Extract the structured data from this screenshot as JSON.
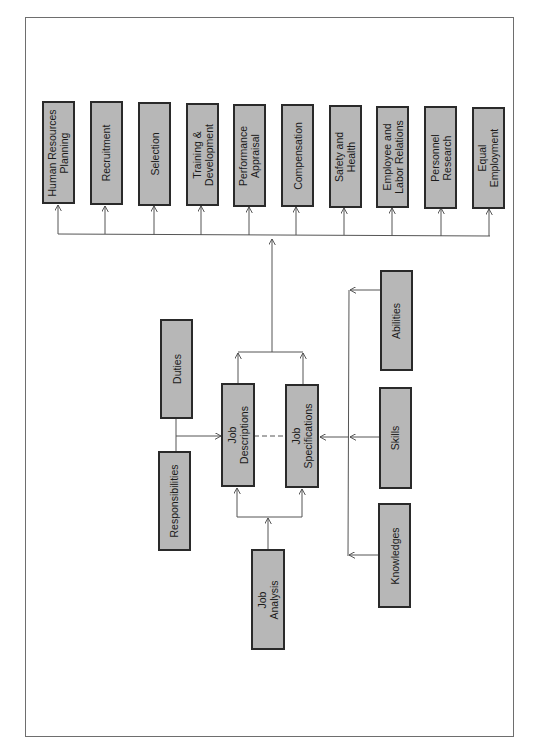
{
  "diagram": {
    "title": "",
    "functions": [
      {
        "id": "hrp",
        "label": "Human Resources\nPlanning"
      },
      {
        "id": "recruitment",
        "label": "Recruitment"
      },
      {
        "id": "selection",
        "label": "Selection"
      },
      {
        "id": "training",
        "label": "Training &\nDevelopment"
      },
      {
        "id": "appraisal",
        "label": "Performance\nAppraisal"
      },
      {
        "id": "compensation",
        "label": "Compensation"
      },
      {
        "id": "safety",
        "label": "Safety and\nHealth"
      },
      {
        "id": "labor",
        "label": "Employee and\nLabor Relations"
      },
      {
        "id": "research",
        "label": "Personnel\nResearch"
      },
      {
        "id": "equal",
        "label": "Equal\nEmployment"
      }
    ],
    "job_descriptions": {
      "label": "Job\nDescriptions"
    },
    "job_specifications": {
      "label": "Job\nSpecifications"
    },
    "job_analysis": {
      "label": "Job\nAnalysis"
    },
    "duties": {
      "label": "Duties"
    },
    "responsibilities": {
      "label": "Responsibilities"
    },
    "abilities": {
      "label": "Abilities"
    },
    "skills": {
      "label": "Skills"
    },
    "knowledges": {
      "label": "Knowledges"
    },
    "colors": {
      "box_fill": "#b7b7b7",
      "box_border": "#2a2a2a",
      "line": "#555555",
      "frame": "#6e6e6e"
    }
  }
}
